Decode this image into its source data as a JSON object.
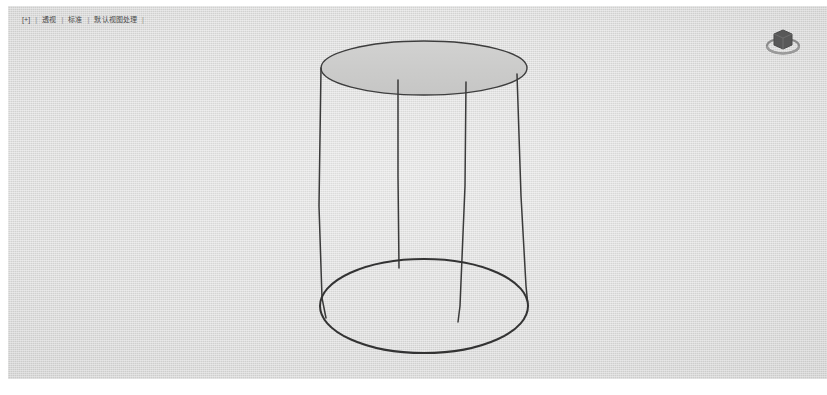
{
  "app": {
    "title": "3D Viewport",
    "background_color": "#dededd",
    "wire_color": "#3c3c3c"
  },
  "viewport": {
    "header": {
      "collapse_toggle": "[+]",
      "separator": "|",
      "items": [
        {
          "label": "透视"
        },
        {
          "label": "标准"
        },
        {
          "label": "默认视图处理"
        }
      ]
    },
    "gizmo": {
      "name": "view-orientation-gizmo",
      "tooltip": "视图方向"
    },
    "scene": {
      "object_name": "圆柱体",
      "shading": "实体",
      "geometry": {
        "type": "cylinder",
        "top_ellipse": {
          "cx": 424,
          "cy": 62,
          "rx": 102,
          "ry": 27
        },
        "bottom_ellipse": {
          "cx": 424,
          "cy": 300,
          "rx": 103,
          "ry": 47
        },
        "vertical_edges": [
          {
            "x_top": 330,
            "x_bottom": 322
          },
          {
            "x_top": 398,
            "x_bottom": 398
          },
          {
            "x_top": 466,
            "x_bottom": 459
          },
          {
            "x_top": 517,
            "x_bottom": 527
          }
        ]
      }
    }
  }
}
